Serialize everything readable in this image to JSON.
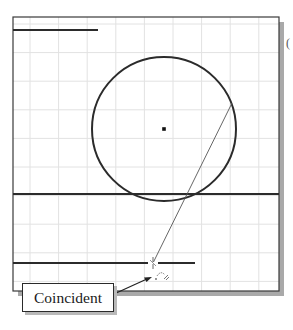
{
  "sketch": {
    "frame": {
      "x": 13,
      "y": 17,
      "width": 266,
      "height": 274
    },
    "grid": {
      "spacing": 28.6,
      "color": "#e2e2e2"
    },
    "colors": {
      "geometry": "#2b2b2b",
      "frame": "#3a3a3a",
      "shadow": "#a9a9a9",
      "background": "#ffffff"
    },
    "entities": {
      "top_line": {
        "x1": 13,
        "y1": 30,
        "x2": 98,
        "y2": 30
      },
      "circle": {
        "cx": 164,
        "cy": 129,
        "r": 72
      },
      "center_point": {
        "x": 164,
        "y": 129
      },
      "long_line": {
        "x1": 13,
        "y1": 194,
        "x2": 279,
        "y2": 194
      },
      "bottom_line": {
        "x1": 13,
        "y1": 263,
        "x2": 195,
        "y2": 263
      },
      "rubber_band_line": {
        "x1": 232,
        "y1": 103,
        "x2": 153,
        "y2": 263
      }
    },
    "cursor": {
      "x": 153,
      "y": 263
    },
    "constraint_icon": {
      "name": "coincident-constraint",
      "x": 160,
      "y": 278
    }
  },
  "callout": {
    "label": "Coincident",
    "arrow_target": {
      "x": 152,
      "y": 277
    }
  },
  "edge_glyph": "("
}
